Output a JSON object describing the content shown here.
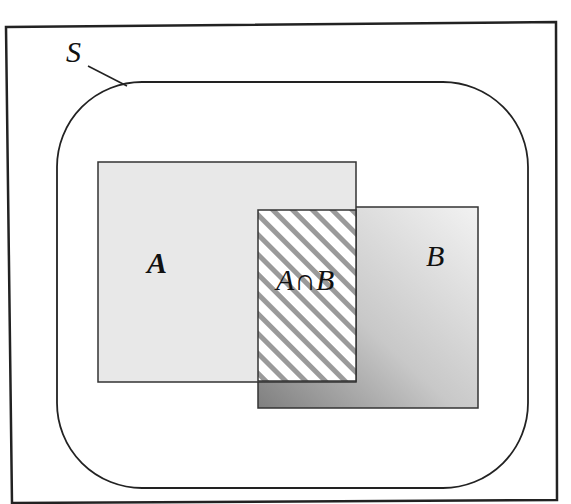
{
  "diagram": {
    "type": "venn-rectangles",
    "universe_label": "S",
    "set_a_label": "A",
    "set_b_label": "B",
    "intersection_label": "A∩B",
    "colors": {
      "stroke": "#222222",
      "set_a_fill": "#e6e6e6",
      "set_b_fill_light": "#eeeeee",
      "set_b_fill_dark": "#8e8e8e",
      "hatch": "#9a9a9a"
    }
  }
}
